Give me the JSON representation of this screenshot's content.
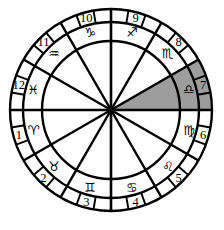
{
  "figure": {
    "background_color": "#ffffff",
    "line_color": "#000000",
    "highlight_color": "#9d9d9d"
  },
  "wheel": {
    "center_x": 111,
    "center_y": 110,
    "outer_radius": 101,
    "tick_ring_radius": 88,
    "inner_ring_radius": 69,
    "hub_radius": 4,
    "sector_count": 12,
    "sector_degrees": 30,
    "ticks_per_sector": 2,
    "highlighted_house": 7,
    "highlighted_sign": "Libra"
  },
  "sectors": [
    {
      "house": "1",
      "sign_name": "Aries",
      "glyph": "♈",
      "start_angle": 180,
      "end_angle": 210,
      "highlighted": false
    },
    {
      "house": "2",
      "sign_name": "Taurus",
      "glyph": "♉",
      "start_angle": 210,
      "end_angle": 240,
      "highlighted": false
    },
    {
      "house": "3",
      "sign_name": "Gemini",
      "glyph": "♊",
      "start_angle": 240,
      "end_angle": 270,
      "highlighted": false
    },
    {
      "house": "4",
      "sign_name": "Cancer",
      "glyph": "♋",
      "start_angle": 270,
      "end_angle": 300,
      "highlighted": false
    },
    {
      "house": "5",
      "sign_name": "Leo",
      "glyph": "♌",
      "start_angle": 300,
      "end_angle": 330,
      "highlighted": false
    },
    {
      "house": "6",
      "sign_name": "Virgo",
      "glyph": "♍",
      "start_angle": 330,
      "end_angle": 360,
      "highlighted": false
    },
    {
      "house": "7",
      "sign_name": "Libra",
      "glyph": "♎",
      "start_angle": 0,
      "end_angle": 30,
      "highlighted": true
    },
    {
      "house": "8",
      "sign_name": "Scorpio",
      "glyph": "♏",
      "start_angle": 30,
      "end_angle": 60,
      "highlighted": false
    },
    {
      "house": "9",
      "sign_name": "Sagittarius",
      "glyph": "♐",
      "start_angle": 60,
      "end_angle": 90,
      "highlighted": false
    },
    {
      "house": "10",
      "sign_name": "Capricorn",
      "glyph": "♑",
      "start_angle": 90,
      "end_angle": 120,
      "highlighted": false
    },
    {
      "house": "11",
      "sign_name": "Aquarius",
      "glyph": "♒",
      "start_angle": 120,
      "end_angle": 150,
      "highlighted": false
    },
    {
      "house": "12",
      "sign_name": "Pisces",
      "glyph": "♓",
      "start_angle": 150,
      "end_angle": 180,
      "highlighted": false
    }
  ]
}
